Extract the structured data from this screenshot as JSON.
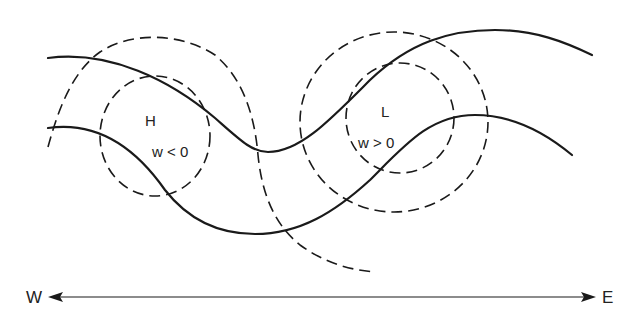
{
  "diagram": {
    "centers": [
      {
        "id": "high",
        "label": "H",
        "condition": "w < 0"
      },
      {
        "id": "low",
        "label": "L",
        "condition": "w > 0"
      }
    ],
    "axis": {
      "west_label": "W",
      "east_label": "E"
    },
    "lines": {
      "solid": "streamlines (2 wavy curves)",
      "dashed": "concentric contours around H and L"
    },
    "colors": {
      "ink": "#1a1a1a",
      "background": "#ffffff"
    }
  }
}
